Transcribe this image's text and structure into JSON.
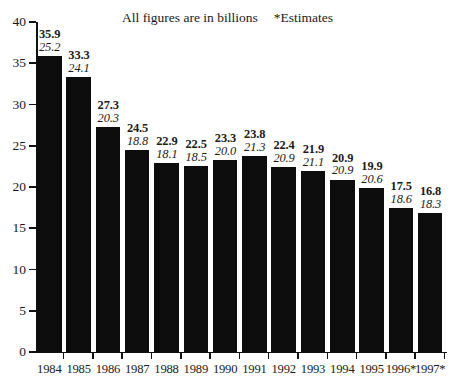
{
  "header": {
    "note_main": "All figures are in billions",
    "note_estimates": "*Estimates"
  },
  "chart_data": {
    "type": "bar",
    "title": "",
    "subtitle": "All figures are in billions",
    "annotations": [
      "*Estimates"
    ],
    "xlabel": "",
    "ylabel": "",
    "ylim": [
      0,
      40
    ],
    "ytick_labels": [
      "40",
      "35",
      "30",
      "25",
      "20",
      "15",
      "10",
      "5",
      "0"
    ],
    "yticks": [
      40,
      35,
      30,
      25,
      20,
      15,
      10,
      5,
      0
    ],
    "grid": false,
    "legend": "none",
    "categories": [
      "1984",
      "1985",
      "1986",
      "1987",
      "1988",
      "1989",
      "1990",
      "1991",
      "1992",
      "1993",
      "1994",
      "1995",
      "1996*",
      "1997*"
    ],
    "values": [
      35.9,
      33.3,
      27.3,
      24.5,
      22.9,
      22.5,
      23.3,
      23.8,
      22.4,
      21.9,
      20.9,
      19.9,
      17.5,
      16.8
    ],
    "series": [
      {
        "name": "primary",
        "style": "bold",
        "values": [
          35.9,
          33.3,
          27.3,
          24.5,
          22.9,
          22.5,
          23.3,
          23.8,
          22.4,
          21.9,
          20.9,
          19.9,
          17.5,
          16.8
        ]
      },
      {
        "name": "secondary",
        "style": "italic",
        "values": [
          25.2,
          24.1,
          20.3,
          18.8,
          18.1,
          18.5,
          20.0,
          21.3,
          20.9,
          21.1,
          20.9,
          20.6,
          18.6,
          18.3
        ]
      }
    ],
    "points": [
      {
        "category": "1984",
        "primary": "35.9",
        "secondary": "25.2"
      },
      {
        "category": "1985",
        "primary": "33.3",
        "secondary": "24.1"
      },
      {
        "category": "1986",
        "primary": "27.3",
        "secondary": "20.3"
      },
      {
        "category": "1987",
        "primary": "24.5",
        "secondary": "18.8"
      },
      {
        "category": "1988",
        "primary": "22.9",
        "secondary": "18.1"
      },
      {
        "category": "1989",
        "primary": "22.5",
        "secondary": "18.5"
      },
      {
        "category": "1990",
        "primary": "23.3",
        "secondary": "20.0"
      },
      {
        "category": "1991",
        "primary": "23.8",
        "secondary": "21.3"
      },
      {
        "category": "1992",
        "primary": "22.4",
        "secondary": "20.9"
      },
      {
        "category": "1993",
        "primary": "21.9",
        "secondary": "21.1"
      },
      {
        "category": "1994",
        "primary": "20.9",
        "secondary": "20.9"
      },
      {
        "category": "1995",
        "primary": "19.9",
        "secondary": "20.6"
      },
      {
        "category": "1996*",
        "primary": "17.5",
        "secondary": "18.6"
      },
      {
        "category": "1997*",
        "primary": "16.8",
        "secondary": "18.3"
      }
    ],
    "colors": {
      "bar": "#0d0d0d",
      "axis": "#111111",
      "text": "#1a1a1a",
      "background": "#ffffff"
    }
  }
}
